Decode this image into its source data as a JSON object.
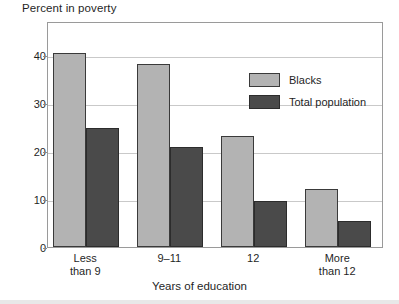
{
  "chart_data": {
    "type": "bar",
    "title": "Percent in poverty",
    "xlabel": "Years of education",
    "ylabel": "",
    "categories": [
      "Less\nthan 9",
      "9–11",
      "12",
      "More\nthan 12"
    ],
    "series": [
      {
        "name": "Blacks",
        "color": "#b3b3b3",
        "values": [
          40.3,
          38.0,
          23.0,
          12.1
        ]
      },
      {
        "name": "Total population",
        "color": "#4a4a4a",
        "values": [
          24.7,
          20.8,
          9.5,
          5.4
        ]
      }
    ],
    "ylim": [
      0,
      47
    ],
    "yticks": [
      0,
      10,
      20,
      30,
      40
    ],
    "ytick_labels": [
      "0",
      "10",
      "20",
      "30",
      "40"
    ],
    "grid": true,
    "legend_position": "inside-top-right"
  },
  "legend": {
    "items": [
      {
        "label": "Blacks"
      },
      {
        "label": "Total population"
      }
    ]
  }
}
